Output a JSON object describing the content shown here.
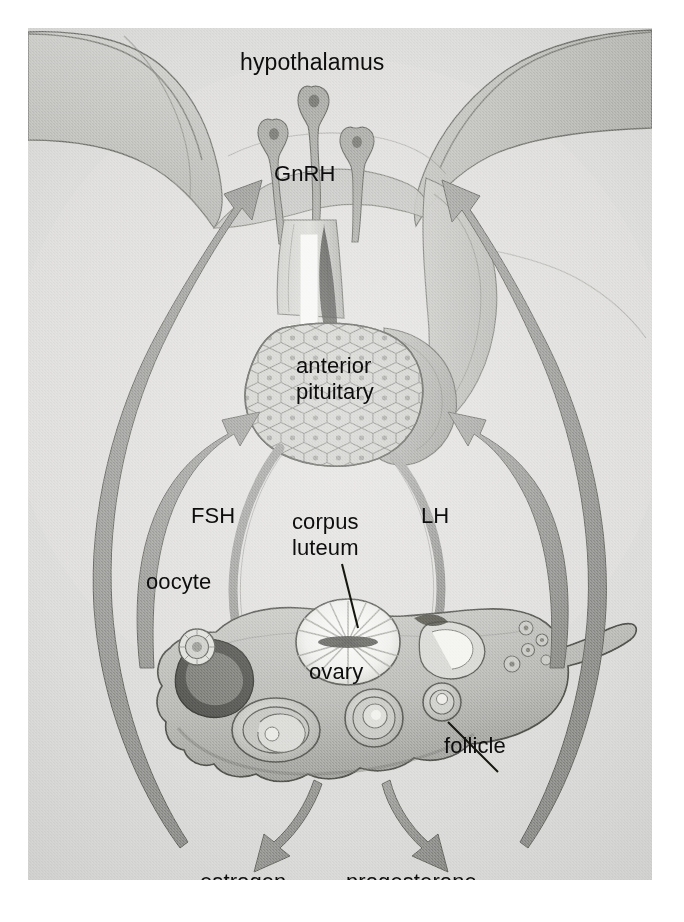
{
  "figure": {
    "background_color": "#d8d8d6",
    "paper_color": "#ffffff",
    "label_color": "#0d0d0d",
    "arrow_color": "#8c8c8a",
    "feedback_arrow_color": "#8a8a88",
    "outline_color": "#4a4a48",
    "white_arrow_color": "#f4f4f2"
  },
  "labels": {
    "hypothalamus": "hypothalamus",
    "gnrh": "GnRH",
    "anterior": "anterior",
    "pituitary": "pituitary",
    "fsh": "FSH",
    "lh": "LH",
    "corpus": "corpus",
    "luteum": "luteum",
    "oocyte": "oocyte",
    "ovary": "ovary",
    "follicle": "follicle",
    "estrogen": "estrogen",
    "progesterone": "progesterone"
  },
  "structures": [
    {
      "name": "hypothalamus",
      "kind": "organ",
      "label": "hypothalamus"
    },
    {
      "name": "gnrh-neurons",
      "kind": "cells",
      "count": 3,
      "label": "GnRH"
    },
    {
      "name": "pituitary-stalk",
      "kind": "stalk",
      "label": ""
    },
    {
      "name": "anterior-pituitary",
      "kind": "organ",
      "label": "anterior pituitary"
    },
    {
      "name": "ovary",
      "kind": "organ",
      "label": "ovary"
    },
    {
      "name": "corpus-luteum",
      "kind": "structure",
      "label": "corpus luteum"
    },
    {
      "name": "follicle",
      "kind": "structure",
      "label": "follicle"
    },
    {
      "name": "oocyte",
      "kind": "cell",
      "label": "oocyte"
    }
  ],
  "arrows": [
    {
      "name": "gnrh-arrow",
      "from": "hypothalamus",
      "to": "anterior-pituitary",
      "signal": "GnRH",
      "style": "white-solid"
    },
    {
      "name": "fsh-arrow",
      "from": "anterior-pituitary",
      "to": "ovary",
      "signal": "FSH",
      "style": "gray-curved"
    },
    {
      "name": "lh-arrow",
      "from": "anterior-pituitary",
      "to": "ovary",
      "signal": "LH",
      "style": "gray-curved"
    },
    {
      "name": "estrogen-arrow",
      "from": "ovary",
      "to": "estrogen",
      "signal": "estrogen",
      "style": "gray-down"
    },
    {
      "name": "progesterone-arrow",
      "from": "ovary",
      "to": "progesterone",
      "signal": "progesterone",
      "style": "gray-down"
    },
    {
      "name": "feedback-left-outer",
      "from": "ovary",
      "to": "hypothalamus",
      "signal": "negative feedback",
      "style": "gray-long"
    },
    {
      "name": "feedback-right-outer",
      "from": "ovary",
      "to": "hypothalamus",
      "signal": "negative feedback",
      "style": "gray-long"
    },
    {
      "name": "feedback-left-inner",
      "from": "ovary",
      "to": "anterior-pituitary",
      "signal": "negative feedback",
      "style": "gray-long"
    },
    {
      "name": "feedback-right-inner",
      "from": "ovary",
      "to": "anterior-pituitary",
      "signal": "negative feedback",
      "style": "gray-long"
    }
  ]
}
